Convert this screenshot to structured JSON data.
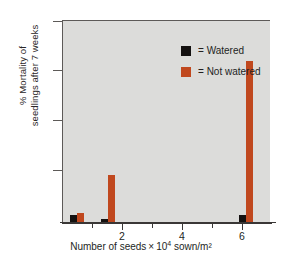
{
  "chart_data": {
    "type": "bar",
    "title": "",
    "xlabel_parts": {
      "prefix": "Number of seeds",
      "times": "×",
      "base": "10",
      "exponent": "4",
      "suffix": "sown/m²"
    },
    "xlabel": "Number of seeds × 10⁴ sown/m²",
    "ylabel_line1": "% Mortality of",
    "ylabel_line2": "seedlings after 7 weeks",
    "ylabel": "% Mortality of seedlings after 7 weeks",
    "ylim": [
      0,
      80
    ],
    "yticks": [
      20,
      40,
      60,
      80
    ],
    "xlim": [
      0,
      6.8
    ],
    "xticks": [
      2,
      4,
      6
    ],
    "xminorticks": [
      1,
      3,
      5
    ],
    "grid": false,
    "legend_position": "top-center",
    "categories": [
      0.5,
      1.5,
      6.0
    ],
    "series": [
      {
        "name": "Watered",
        "color": "#141110",
        "values": [
          3,
          1.5,
          3
        ]
      },
      {
        "name": "Not watered",
        "color": "#c0481e",
        "values": [
          4,
          19,
          64
        ]
      }
    ]
  },
  "legend": {
    "items": [
      {
        "equals": "=",
        "label": "Watered",
        "swatch": "black-square"
      },
      {
        "equals": "=",
        "label": "Not watered",
        "swatch": "orange-square"
      }
    ]
  },
  "colors": {
    "watered": "#141110",
    "not_watered": "#c0481e",
    "plot_background": "#dcdcda",
    "axis": "#3a3736",
    "page_background": "#ffffff"
  },
  "axis_labels": {
    "y": [
      "80",
      "60",
      "40",
      "20"
    ],
    "x": [
      "2",
      "4",
      "6"
    ]
  }
}
